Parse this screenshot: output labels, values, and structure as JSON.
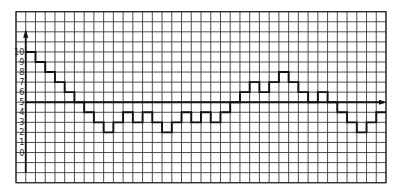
{
  "chart_data": {
    "type": "line",
    "subtype": "step",
    "title": "",
    "xlabel": "",
    "ylabel": "",
    "x_tick_labels": [],
    "y_tick_labels": [
      "10",
      "9",
      "8",
      "7",
      "6",
      "5",
      "4",
      "3",
      "2",
      "1",
      "0"
    ],
    "y_ticks": [
      10,
      9,
      8,
      7,
      6,
      5,
      4,
      3,
      2,
      1,
      0
    ],
    "xlim": [
      -1,
      37
    ],
    "ylim": [
      -3,
      14
    ],
    "grid": true,
    "x_axis_at_y": 5,
    "y_axis_at_x": 0,
    "axis_arrows": [
      "y-up",
      "x-right"
    ],
    "legend": null,
    "series": [
      {
        "name": "step-signal",
        "x": [
          0,
          1,
          2,
          3,
          4,
          5,
          6,
          7,
          8,
          9,
          10,
          11,
          12,
          13,
          14,
          15,
          16,
          17,
          18,
          19,
          20,
          21,
          22,
          23,
          24,
          25,
          26,
          27,
          28,
          29,
          30,
          31,
          32,
          33,
          34,
          35,
          36
        ],
        "values": [
          10,
          9,
          8,
          7,
          6,
          5,
          4,
          3,
          2,
          3,
          4,
          3,
          4,
          3,
          2,
          3,
          4,
          3,
          4,
          3,
          4,
          5,
          6,
          7,
          6,
          7,
          8,
          7,
          6,
          5,
          6,
          5,
          4,
          3,
          2,
          3,
          4
        ]
      }
    ]
  }
}
